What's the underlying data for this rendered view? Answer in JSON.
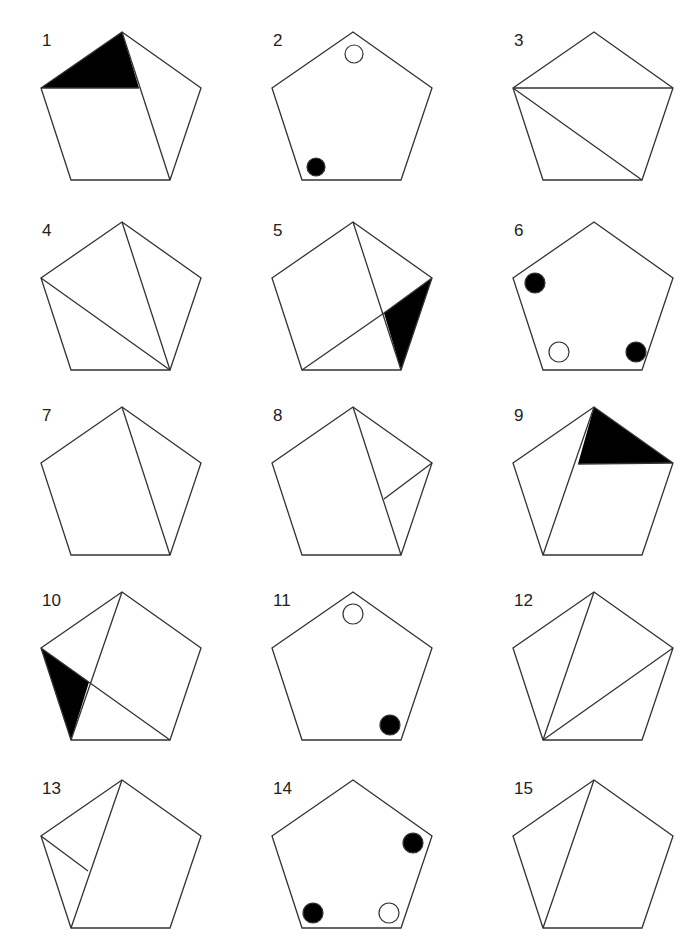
{
  "colors": {
    "stroke": "#333333",
    "fill_black": "#000000",
    "background": "#ffffff"
  },
  "pentagon": {
    "vertices": {
      "top": [
        122,
        32
      ],
      "left": [
        41,
        88
      ],
      "right": [
        201,
        88
      ],
      "bottom_left": [
        71,
        180
      ],
      "bottom_right": [
        170,
        180
      ]
    }
  },
  "figures": [
    {
      "label": "1",
      "col": 0,
      "top": 0,
      "lines": [
        [
          "top",
          "bottom_right"
        ],
        [
          "left",
          "p_1a"
        ]
      ],
      "points": {
        "p_1a": [
          139,
          88
        ]
      },
      "fills": [
        [
          "top",
          "left",
          "p_1a"
        ]
      ],
      "circles": []
    },
    {
      "label": "2",
      "col": 1,
      "top": 0,
      "lines": [],
      "points": {},
      "fills": [],
      "circles": [
        {
          "cx": 123,
          "cy": 54,
          "r": 9,
          "filled": false
        },
        {
          "cx": 85,
          "cy": 167,
          "r": 9,
          "filled": true
        }
      ]
    },
    {
      "label": "3",
      "col": 2,
      "top": 0,
      "lines": [
        [
          "left",
          "right"
        ],
        [
          "left",
          "bottom_right"
        ]
      ],
      "points": {},
      "fills": [],
      "circles": []
    },
    {
      "label": "4",
      "col": 0,
      "top": 190,
      "lines": [
        [
          "top",
          "bottom_right"
        ],
        [
          "left",
          "bottom_right"
        ]
      ],
      "points": {},
      "fills": [],
      "circles": []
    },
    {
      "label": "5",
      "col": 1,
      "top": 190,
      "lines": [
        [
          "top",
          "bottom_right"
        ],
        [
          "bottom_left",
          "p_5a"
        ]
      ],
      "points": {
        "p_5a": [
          153,
          123
        ]
      },
      "fills": [
        [
          "p_5a",
          "right",
          "bottom_right"
        ]
      ],
      "circles": [],
      "extra_lines": [
        [
          "p_5a",
          "right"
        ]
      ]
    },
    {
      "label": "6",
      "col": 2,
      "top": 190,
      "lines": [],
      "points": {},
      "fills": [],
      "circles": [
        {
          "cx": 63,
          "cy": 93,
          "r": 10,
          "filled": true
        },
        {
          "cx": 87,
          "cy": 162,
          "r": 10,
          "filled": false
        },
        {
          "cx": 164,
          "cy": 162,
          "r": 10,
          "filled": true
        }
      ]
    },
    {
      "label": "7",
      "col": 0,
      "top": 375,
      "lines": [
        [
          "top",
          "bottom_right"
        ]
      ],
      "points": {},
      "fills": [],
      "circles": []
    },
    {
      "label": "8",
      "col": 1,
      "top": 375,
      "lines": [
        [
          "top",
          "bottom_right"
        ],
        [
          "right",
          "p_8a"
        ]
      ],
      "points": {
        "p_8a": [
          153,
          124
        ]
      },
      "fills": [],
      "circles": []
    },
    {
      "label": "9",
      "col": 2,
      "top": 375,
      "lines": [
        [
          "top",
          "bottom_left"
        ],
        [
          "p_9a",
          "right"
        ]
      ],
      "points": {
        "p_9a": [
          106,
          89
        ]
      },
      "fills": [
        [
          "top",
          "p_9a",
          "right"
        ]
      ],
      "circles": []
    },
    {
      "label": "10",
      "col": 0,
      "top": 560,
      "lines": [
        [
          "top",
          "bottom_left"
        ],
        [
          "left",
          "bottom_right"
        ]
      ],
      "points": {
        "p_10a": [
          89,
          122
        ]
      },
      "fills": [
        [
          "left",
          "p_10a",
          "bottom_left"
        ]
      ],
      "circles": []
    },
    {
      "label": "11",
      "col": 1,
      "top": 560,
      "lines": [],
      "points": {},
      "fills": [],
      "circles": [
        {
          "cx": 122,
          "cy": 54,
          "r": 10,
          "filled": false
        },
        {
          "cx": 159,
          "cy": 165,
          "r": 10,
          "filled": true
        }
      ]
    },
    {
      "label": "12",
      "col": 2,
      "top": 560,
      "lines": [
        [
          "top",
          "bottom_left"
        ],
        [
          "right",
          "bottom_left"
        ]
      ],
      "points": {},
      "fills": [],
      "circles": []
    },
    {
      "label": "13",
      "col": 0,
      "top": 748,
      "lines": [
        [
          "top",
          "bottom_left"
        ],
        [
          "left",
          "p_13a"
        ]
      ],
      "points": {
        "p_13a": [
          88,
          123
        ]
      },
      "fills": [],
      "circles": []
    },
    {
      "label": "14",
      "col": 1,
      "top": 748,
      "lines": [],
      "points": {},
      "fills": [],
      "circles": [
        {
          "cx": 182,
          "cy": 95,
          "r": 10,
          "filled": true
        },
        {
          "cx": 82,
          "cy": 165,
          "r": 10,
          "filled": true
        },
        {
          "cx": 158,
          "cy": 165,
          "r": 10,
          "filled": false
        }
      ]
    },
    {
      "label": "15",
      "col": 2,
      "top": 748,
      "lines": [
        [
          "top",
          "bottom_left"
        ]
      ],
      "points": {},
      "fills": [],
      "circles": []
    }
  ]
}
